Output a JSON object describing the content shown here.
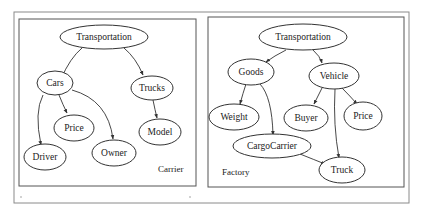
{
  "figure": {
    "panels": [
      {
        "name": "Carrier",
        "nodes": {
          "transportation": "Transportation",
          "cars": "Cars",
          "trucks": "Trucks",
          "price": "Price",
          "model": "Model",
          "driver": "Driver",
          "owner": "Owner"
        },
        "edges": [
          [
            "Transportation",
            "Cars"
          ],
          [
            "Transportation",
            "Trucks"
          ],
          [
            "Cars",
            "Price"
          ],
          [
            "Cars",
            "Driver"
          ],
          [
            "Cars",
            "Owner"
          ],
          [
            "Trucks",
            "Model"
          ]
        ]
      },
      {
        "name": "Factory",
        "nodes": {
          "transportation": "Transportation",
          "goods": "Goods",
          "vehicle": "Vehicle",
          "weight": "Weight",
          "buyer": "Buyer",
          "price": "Price",
          "cargocarrier": "CargoCarrier",
          "truck": "Truck"
        },
        "edges": [
          [
            "Transportation",
            "Goods"
          ],
          [
            "Transportation",
            "Vehicle"
          ],
          [
            "Goods",
            "Weight"
          ],
          [
            "Goods",
            "CargoCarrier"
          ],
          [
            "Vehicle",
            "Buyer"
          ],
          [
            "Vehicle",
            "Price"
          ],
          [
            "Vehicle",
            "Truck"
          ],
          [
            "CargoCarrier",
            "Truck"
          ]
        ]
      }
    ]
  }
}
